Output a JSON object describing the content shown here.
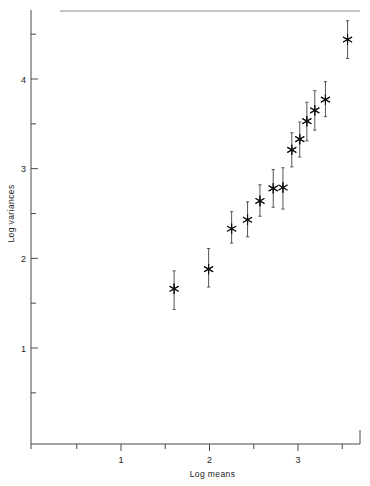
{
  "chart_data": {
    "type": "scatter",
    "title": "",
    "xlabel": "Log means",
    "ylabel": "Log variances",
    "grid": false,
    "legend": null,
    "xlim": [
      0.38,
      3.78
    ],
    "ylim": [
      0.18,
      4.78
    ],
    "x_ticks_major": [
      1,
      2,
      3
    ],
    "x_tick_labels": [
      "1",
      "2",
      "3"
    ],
    "x_ticks_minor": [
      0.5,
      1.5,
      2.5,
      3.5
    ],
    "y_ticks_major": [
      1,
      2,
      3,
      4
    ],
    "y_tick_labels": [
      "1",
      "2",
      "3",
      "4"
    ],
    "y_ticks_minor": [
      0.5,
      1.5,
      2.5,
      3.5,
      4.5
    ],
    "marker": "asterisk",
    "error_bars": "vertical",
    "points": [
      {
        "x": 1.6,
        "y": 1.66,
        "ylow": 1.43,
        "yhigh": 1.86
      },
      {
        "x": 1.99,
        "y": 1.88,
        "ylow": 1.68,
        "yhigh": 2.11
      },
      {
        "x": 2.25,
        "y": 2.33,
        "ylow": 2.17,
        "yhigh": 2.52
      },
      {
        "x": 2.43,
        "y": 2.43,
        "ylow": 2.24,
        "yhigh": 2.63
      },
      {
        "x": 2.57,
        "y": 2.64,
        "ylow": 2.47,
        "yhigh": 2.82
      },
      {
        "x": 2.72,
        "y": 2.78,
        "ylow": 2.57,
        "yhigh": 2.99
      },
      {
        "x": 2.83,
        "y": 2.79,
        "ylow": 2.55,
        "yhigh": 3.01
      },
      {
        "x": 2.93,
        "y": 3.21,
        "ylow": 3.02,
        "yhigh": 3.4
      },
      {
        "x": 3.02,
        "y": 3.33,
        "ylow": 3.13,
        "yhigh": 3.52
      },
      {
        "x": 3.1,
        "y": 3.53,
        "ylow": 3.31,
        "yhigh": 3.74
      },
      {
        "x": 3.19,
        "y": 3.65,
        "ylow": 3.43,
        "yhigh": 3.87
      },
      {
        "x": 3.31,
        "y": 3.77,
        "ylow": 3.58,
        "yhigh": 3.97
      },
      {
        "x": 3.56,
        "y": 4.44,
        "ylow": 4.23,
        "yhigh": 4.65
      }
    ]
  },
  "axes": {
    "x_title": "Log means",
    "y_title": "Log variances"
  },
  "colors": {
    "marker": "#111111",
    "errorbar": "#555555",
    "axis": "#4a4a4a",
    "background": "#ffffff"
  }
}
